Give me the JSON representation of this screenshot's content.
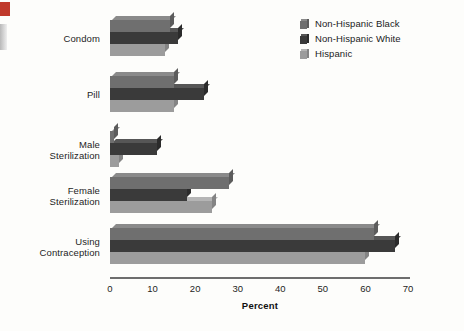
{
  "chart_data": {
    "type": "bar",
    "orientation": "horizontal",
    "title": "",
    "xlabel": "Percent",
    "ylabel": "",
    "xlim": [
      0,
      70
    ],
    "xticks": [
      0,
      10,
      20,
      30,
      40,
      50,
      60,
      70
    ],
    "grid": false,
    "legend_position": "top-right",
    "categories": [
      "Condom",
      "Pill",
      "Male Sterilization",
      "Female Sterilization",
      "Using Contraception"
    ],
    "category_lines": [
      [
        "Condom"
      ],
      [
        "Pill"
      ],
      [
        "Male",
        "Sterilization"
      ],
      [
        "Female",
        "Sterilization"
      ],
      [
        "Using",
        "Contraception"
      ]
    ],
    "series": [
      {
        "name": "Non-Hispanic Black",
        "color": "#6f6f6f",
        "values": [
          14,
          15,
          1,
          28,
          62
        ]
      },
      {
        "name": "Non-Hispanic White",
        "color": "#3a3a3a",
        "values": [
          16,
          22,
          11,
          18,
          67
        ]
      },
      {
        "name": "Hispanic",
        "color": "#9c9c9c",
        "values": [
          13,
          15,
          2,
          24,
          60
        ]
      }
    ]
  },
  "legend": {
    "items": [
      {
        "label": "Non-Hispanic Black"
      },
      {
        "label": "Non-Hispanic White"
      },
      {
        "label": "Hispanic"
      }
    ]
  },
  "axis": {
    "x_title": "Percent",
    "tick_labels": [
      "0",
      "10",
      "20",
      "30",
      "40",
      "50",
      "60",
      "70"
    ]
  },
  "colors": {
    "non_hispanic_black": "#6f6f6f",
    "non_hispanic_white": "#3a3a3a",
    "hispanic": "#9c9c9c",
    "axis": "#6d6d6d",
    "background": "#fdfdfb",
    "edge_marker": "#c0392b"
  }
}
